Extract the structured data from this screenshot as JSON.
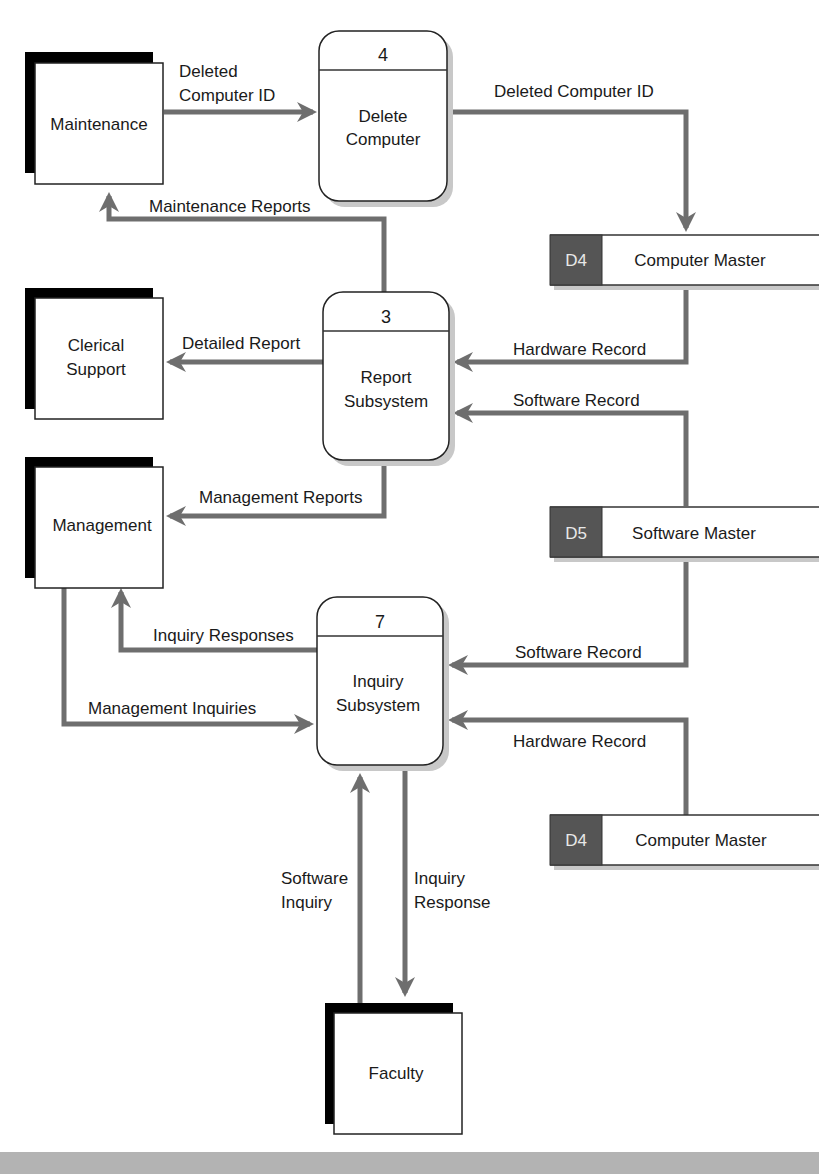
{
  "entities": {
    "maintenance": "Maintenance",
    "clerical_line1": "Clerical",
    "clerical_line2": "Support",
    "management": "Management",
    "faculty": "Faculty"
  },
  "processes": {
    "p4": {
      "number": "4",
      "line1": "Delete",
      "line2": "Computer"
    },
    "p3": {
      "number": "3",
      "line1": "Report",
      "line2": "Subsystem"
    },
    "p7": {
      "number": "7",
      "line1": "Inquiry",
      "line2": "Subsystem"
    }
  },
  "data_stores": {
    "d4_top": {
      "id": "D4",
      "name": "Computer Master"
    },
    "d5": {
      "id": "D5",
      "name": "Software Master"
    },
    "d4_bottom": {
      "id": "D4",
      "name": "Computer Master"
    }
  },
  "flows": {
    "deleted_id_in_1": "Deleted",
    "deleted_id_in_2": "Computer ID",
    "deleted_id_out": "Deleted Computer ID",
    "maintenance_reports": "Maintenance Reports",
    "detailed_report": "Detailed Report",
    "hardware_record_1": "Hardware Record",
    "software_record_1": "Software Record",
    "management_reports": "Management Reports",
    "inquiry_responses": "Inquiry Responses",
    "software_record_2": "Software Record",
    "management_inquiries": "Management Inquiries",
    "hardware_record_2": "Hardware Record",
    "software_inquiry_1": "Software",
    "software_inquiry_2": "Inquiry",
    "inquiry_response_1": "Inquiry",
    "inquiry_response_2": "Response"
  },
  "colors": {
    "flow": "#6e6e6e",
    "datastore_id_fill": "#555555",
    "entity_shadow": "#000000",
    "bottom_band": "#b3b3b3"
  }
}
